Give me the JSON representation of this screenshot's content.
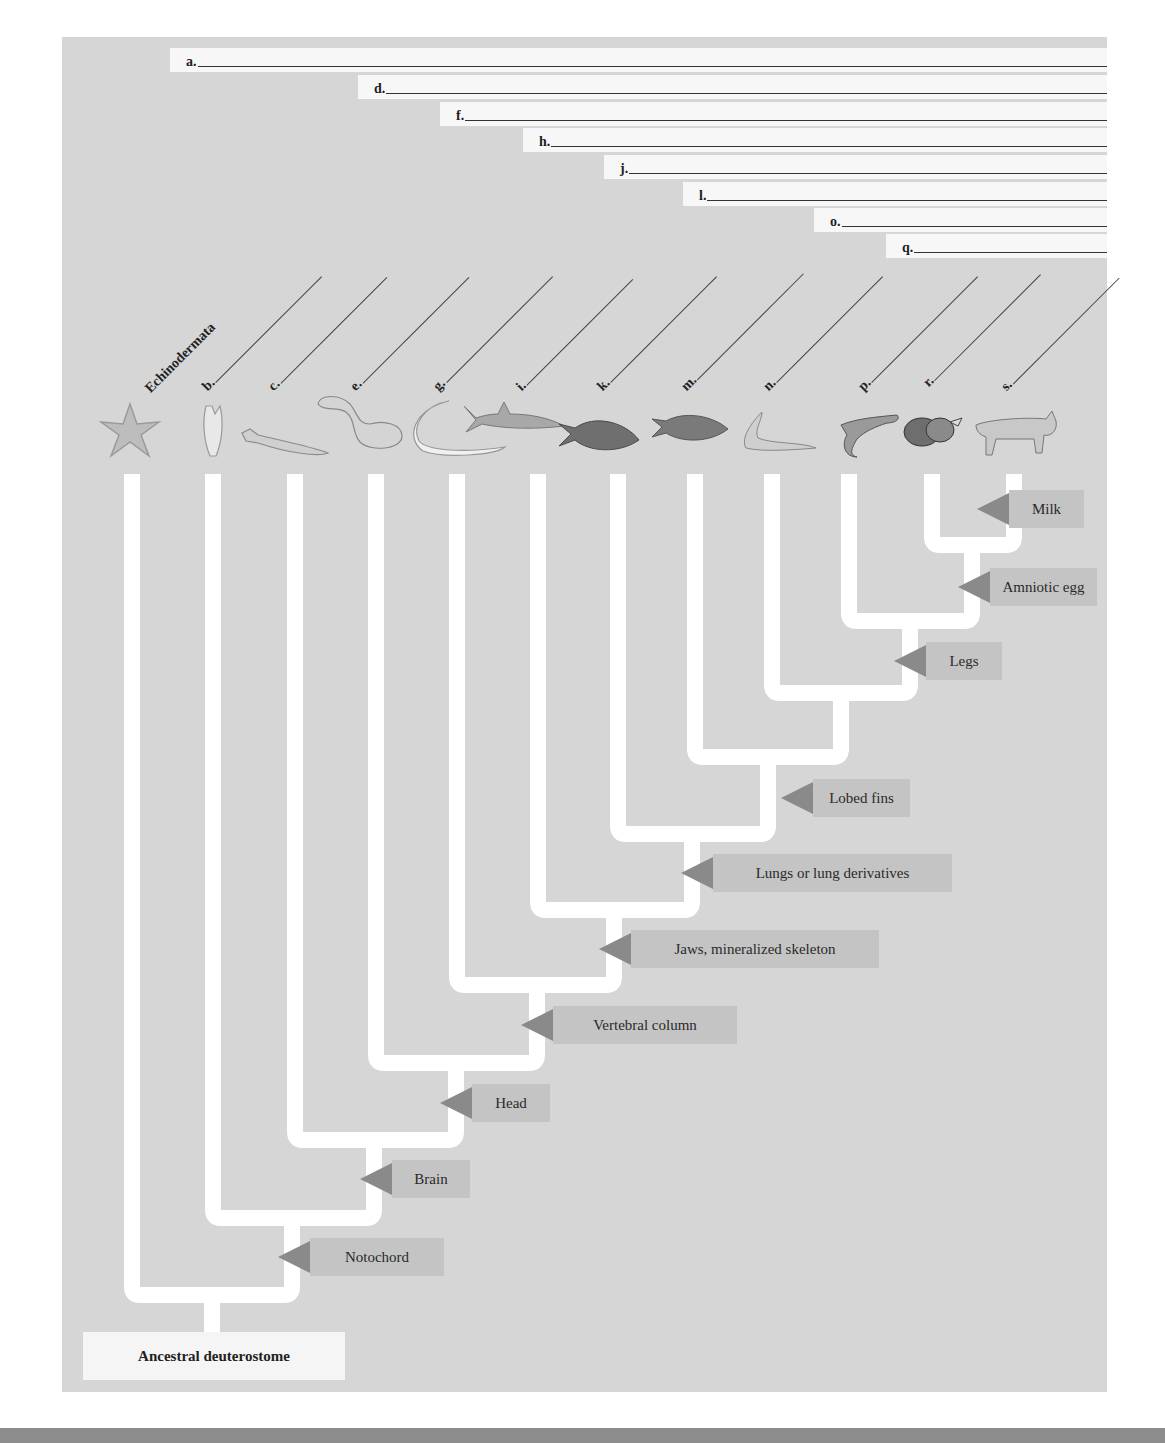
{
  "diagram": {
    "type": "cladogram",
    "root_label": "Ancestral deuterostome",
    "blank_bracket_labels": [
      "a.",
      "d.",
      "f.",
      "h.",
      "j.",
      "l.",
      "o.",
      "q."
    ],
    "taxon_labels": [
      "Echinodermata",
      "b.",
      "c.",
      "e.",
      "g.",
      "i.",
      "k.",
      "m.",
      "n.",
      "p.",
      "r.",
      "s."
    ],
    "traits": [
      {
        "name": "Notochord"
      },
      {
        "name": "Brain"
      },
      {
        "name": "Head"
      },
      {
        "name": "Vertebral column"
      },
      {
        "name": "Jaws, mineralized skeleton"
      },
      {
        "name": "Lungs or lung derivatives"
      },
      {
        "name": "Lobed fins"
      },
      {
        "name": "Legs"
      },
      {
        "name": "Amniotic egg"
      },
      {
        "name": "Milk"
      }
    ],
    "icons": [
      "sea-star-icon",
      "tunicate-icon",
      "lancelet-icon",
      "hagfish-icon",
      "lamprey-icon",
      "shark-icon",
      "ray-finned-fish-icon",
      "coelacanth-icon",
      "lungfish-icon",
      "salamander-icon",
      "snake-icon",
      "bobcat-icon"
    ]
  },
  "colors": {
    "panel_bg": "#d6d6d6",
    "branch": "#ffffff",
    "trait_box": "#c4c4c4",
    "trait_arrow": "#8a8a8a",
    "blank_strip": "#f7f7f7"
  }
}
